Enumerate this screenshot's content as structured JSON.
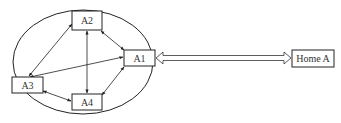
{
  "diagram": {
    "nodes": [
      {
        "id": "A1",
        "label": "A1"
      },
      {
        "id": "A2",
        "label": "A2"
      },
      {
        "id": "A3",
        "label": "A3"
      },
      {
        "id": "A4",
        "label": "A4"
      },
      {
        "id": "HomeA",
        "label": "Home A"
      }
    ],
    "edges": [
      {
        "from": "A2",
        "to": "A1",
        "type": "bidirectional"
      },
      {
        "from": "A2",
        "to": "A3",
        "type": "bidirectional"
      },
      {
        "from": "A2",
        "to": "A4",
        "type": "bidirectional"
      },
      {
        "from": "A3",
        "to": "A1",
        "type": "bidirectional"
      },
      {
        "from": "A3",
        "to": "A4",
        "type": "bidirectional"
      },
      {
        "from": "A4",
        "to": "A1",
        "type": "bidirectional"
      },
      {
        "from": "A1",
        "to": "HomeA",
        "type": "hollow-double-bidirectional"
      }
    ],
    "group": "ellipse enclosing A1, A2, A3, A4"
  }
}
